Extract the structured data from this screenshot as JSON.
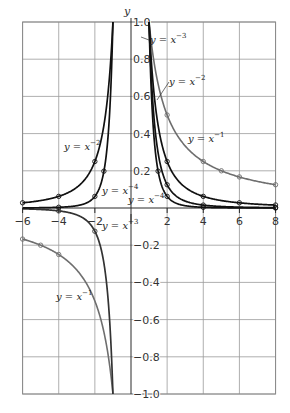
{
  "chart_data": {
    "type": "line",
    "title": "",
    "xlabel": "",
    "ylabel": "y",
    "xlim": [
      -6,
      8
    ],
    "ylim": [
      -1.0,
      1.0
    ],
    "grid": true,
    "legend": "inline labels",
    "x_ticks": [
      -6,
      -4,
      -2,
      2,
      4,
      6,
      8
    ],
    "x_tick_labels": [
      "-6",
      "-4",
      "-2",
      "2",
      "4",
      "6",
      "8"
    ],
    "y_ticks": [
      1.0,
      0.8,
      0.6,
      0.4,
      0.2,
      -0.2,
      -0.4,
      -0.6,
      -0.8,
      -1.0
    ],
    "y_tick_labels": [
      "1.0",
      "0.8",
      "0.6",
      "0.4",
      "0.2",
      "-0.2",
      "-0.4",
      "-0.6",
      "-0.8",
      "-1.0"
    ],
    "series": [
      {
        "name": "y = x^-1",
        "label_text": "y = x",
        "exponent": "-1",
        "power": -1,
        "color": "#6e6e6e",
        "points_pos": [
          [
            1,
            1.0
          ],
          [
            2,
            0.5
          ],
          [
            4,
            0.25
          ],
          [
            5,
            0.2
          ],
          [
            6,
            0.167
          ],
          [
            8,
            0.125
          ]
        ],
        "points_neg": [
          [
            -6,
            -0.167
          ],
          [
            -5,
            -0.2
          ],
          [
            -4,
            -0.25
          ],
          [
            -1,
            -1.0
          ]
        ]
      },
      {
        "name": "y = x^-2",
        "label_text": "y = x",
        "exponent": "-2",
        "power": -2,
        "color": "#111111",
        "points_pos": [
          [
            1,
            1.0
          ],
          [
            2,
            0.25
          ],
          [
            4,
            0.0625
          ],
          [
            6,
            0.028
          ],
          [
            8,
            0.016
          ]
        ],
        "points_neg": [
          [
            -6,
            0.028
          ],
          [
            -4,
            0.0625
          ],
          [
            -2,
            0.25
          ],
          [
            -1,
            1.0
          ]
        ]
      },
      {
        "name": "y = x^-3",
        "label_text": "y = x",
        "exponent": "-3",
        "power": -3,
        "color": "#111111",
        "color_neg": "#333333",
        "points_pos": [
          [
            1,
            1.0
          ],
          [
            2,
            0.125
          ],
          [
            4,
            0.0156
          ],
          [
            8,
            0.002
          ]
        ],
        "points_neg": [
          [
            -4,
            -0.0156
          ],
          [
            -2,
            -0.125
          ],
          [
            -1,
            -1.0
          ]
        ]
      },
      {
        "name": "y = x^-4",
        "label_text": "y = x",
        "exponent": "-4",
        "power": -4,
        "color": "#111111",
        "points_pos": [
          [
            1,
            1.0
          ],
          [
            1.5,
            0.198
          ],
          [
            2,
            0.0625
          ],
          [
            4,
            0.0039
          ],
          [
            8,
            0.0002
          ]
        ],
        "points_neg": [
          [
            -4,
            0.0039
          ],
          [
            -2,
            0.0625
          ],
          [
            -1.5,
            0.198
          ],
          [
            -1,
            1.0
          ]
        ]
      }
    ],
    "annotations": [
      {
        "text": "y = x^-3",
        "series": "x^-3",
        "position": "upper right of y-axis near (2, 0.93)"
      },
      {
        "text": "y = x^-2",
        "series": "x^-2",
        "position": "near (2.3, 0.7)"
      },
      {
        "text": "y = x^-1",
        "series": "x^-1",
        "position": "near (4.5, 0.37)"
      },
      {
        "text": "y = x^-4",
        "series": "x^-4",
        "position": "near (0.7, 0.04)"
      },
      {
        "text": "y = x^-2",
        "series": "x^-2",
        "position": "near (-4.5, 0.35)"
      },
      {
        "text": "y = x^-4",
        "series": "x^-4",
        "position": "near (-1.8, 0.08)"
      },
      {
        "text": "y = x^-3",
        "series": "x^-3",
        "position": "near (-1.3, -0.07)"
      },
      {
        "text": "y = x^-1",
        "series": "x^-1",
        "position": "near (-4, -0.58)"
      }
    ]
  },
  "labels": {
    "y_axis_name": "y",
    "pos_x3": {
      "base": "y = x",
      "exp": "−3"
    },
    "pos_x2": {
      "base": "y = x",
      "exp": "−2"
    },
    "pos_x1": {
      "base": "y = x",
      "exp": "−1"
    },
    "pos_x4": {
      "base": "y = x",
      "exp": "−4"
    },
    "neg_x2": {
      "base": "y = x",
      "exp": "−2"
    },
    "neg_x4": {
      "base": "y = x",
      "exp": "−4"
    },
    "neg_x3": {
      "base": "y = x",
      "exp": "−3"
    },
    "neg_x1": {
      "base": "y = x",
      "exp": "−1"
    }
  }
}
